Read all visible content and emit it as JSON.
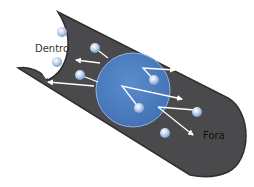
{
  "labels": {
    "inside": "Dentro",
    "outside": "Fora"
  },
  "colors": {
    "tube": "#4a4a4c",
    "tube_edge": "#2f2f31",
    "sphere": "#4f7fc2",
    "sphere_edge": "#8fb2de",
    "molecule": "#b9cde8",
    "arrow": "#ffffff",
    "label_inside": "#333333",
    "label_outside": "#111111"
  },
  "molecules": [
    {
      "cx": 62,
      "cy": 32,
      "region": "inside"
    },
    {
      "cx": 57,
      "cy": 62,
      "region": "inside"
    },
    {
      "cx": 95,
      "cy": 48,
      "region": "tube"
    },
    {
      "cx": 80,
      "cy": 75,
      "region": "tube"
    },
    {
      "cx": 154,
      "cy": 80,
      "region": "sphere"
    },
    {
      "cx": 139,
      "cy": 108,
      "region": "sphere"
    },
    {
      "cx": 197,
      "cy": 112,
      "region": "outside"
    },
    {
      "cx": 165,
      "cy": 133,
      "region": "outside"
    }
  ]
}
